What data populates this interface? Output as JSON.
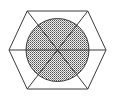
{
  "figure": {
    "background_color": "#ffffff",
    "canvas": {
      "width": 116,
      "height": 100
    },
    "stroke_color": "#3a3a3a",
    "stroke_width": 1,
    "hexagon": {
      "name": "outer-hexagon",
      "orientation": "flat-top",
      "center": {
        "cx": 57.5,
        "cy": 50
      },
      "circumradius": 48.5,
      "vertices": [
        {
          "label": "left",
          "x": 9,
          "y": 50
        },
        {
          "label": "top-left",
          "x": 27.2,
          "y": 11
        },
        {
          "label": "top-right",
          "x": 87.8,
          "y": 11
        },
        {
          "label": "right",
          "x": 106,
          "y": 50
        },
        {
          "label": "bottom-right",
          "x": 87.8,
          "y": 89
        },
        {
          "label": "bottom-left",
          "x": 27.2,
          "y": 89
        }
      ],
      "points_string": "9,50 27.2,11 87.8,11 106,50 87.8,89 27.2,89",
      "fill": "none"
    },
    "circle": {
      "name": "inscribed-circle",
      "center": {
        "cx": 57.5,
        "cy": 50
      },
      "radius": 31.5,
      "fill_pattern": "stipple-dots",
      "pattern_dot_color": "#4a4a4a",
      "pattern_background": "#f2f2f2",
      "pattern_spacing": 2
    },
    "diameters": [
      {
        "name": "diameter-horizontal",
        "angle_degrees": 0,
        "x1": 9,
        "y1": 50,
        "x2": 106,
        "y2": 50
      },
      {
        "name": "diameter-upper-left-to-lower-right",
        "angle_degrees": 60,
        "x1": 27.2,
        "y1": 11,
        "x2": 87.8,
        "y2": 89
      },
      {
        "name": "diameter-upper-right-to-lower-left",
        "angle_degrees": 120,
        "x1": 87.8,
        "y1": 11,
        "x2": 27.2,
        "y2": 89
      }
    ],
    "sector_count": 6,
    "center_point": {
      "name": "center-intersection",
      "x": 57.5,
      "y": 50
    }
  }
}
